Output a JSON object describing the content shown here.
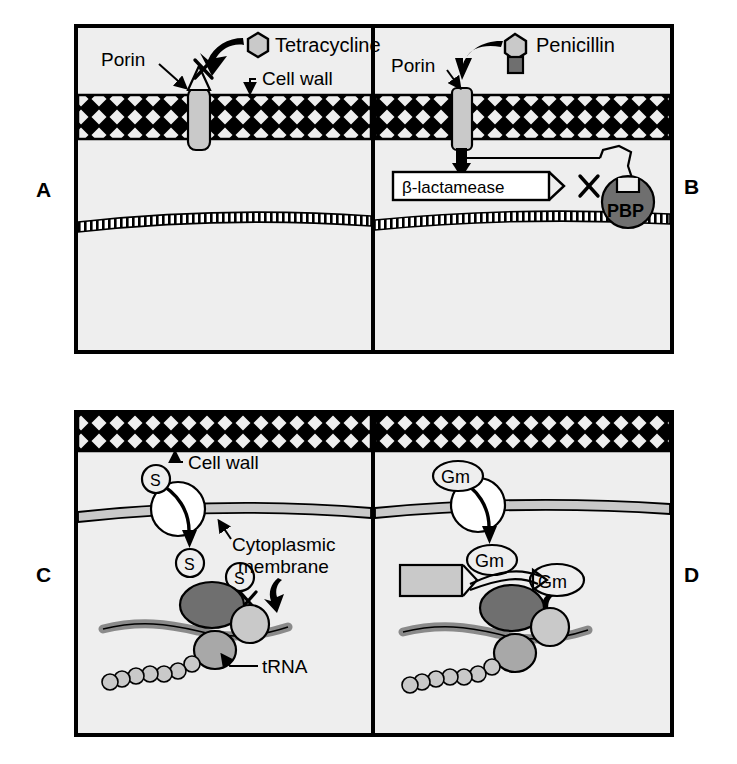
{
  "figure": {
    "background": "#ffffff",
    "panel_fill": "#eeeeee",
    "stroke": "#000000"
  },
  "palette": {
    "panel_fill": "#eeeeee",
    "light_gray": "#c9c9c9",
    "mid_gray": "#a8a8a8",
    "dark_gray": "#6f6f6f",
    "white": "#ffffff",
    "black": "#000000"
  },
  "panels": [
    {
      "id": "A",
      "letter": "A",
      "label_side": "left",
      "mechanism": "decreased-porin-permeability",
      "drug": "Tetracycline",
      "drug_shape": "hexagon",
      "labels": [
        {
          "name": "porin",
          "text": "Porin"
        },
        {
          "name": "drug",
          "text": "Tetracycline"
        },
        {
          "name": "cell-wall",
          "text": "Cell wall"
        },
        {
          "name": "block-marker",
          "text": "X"
        }
      ]
    },
    {
      "id": "B",
      "letter": "B",
      "label_side": "right",
      "mechanism": "enzymatic-drug-inactivation",
      "drug": "Penicillin",
      "drug_shape": "hexagon-with-tail",
      "labels": [
        {
          "name": "porin",
          "text": "Porin"
        },
        {
          "name": "drug",
          "text": "Penicillin"
        },
        {
          "name": "enzyme",
          "text": "β-lactamease"
        },
        {
          "name": "target-protein",
          "text": "PBP"
        },
        {
          "name": "block-marker",
          "text": "X"
        }
      ]
    },
    {
      "id": "C",
      "letter": "C",
      "label_side": "left",
      "mechanism": "altered-ribosomal-target",
      "drug": "S",
      "drug_name_abbrev": "S",
      "labels": [
        {
          "name": "cell-wall",
          "text": "Cell wall"
        },
        {
          "name": "cytoplasmic-membrane-line1",
          "text": "Cytoplasmic"
        },
        {
          "name": "cytoplasmic-membrane-line2",
          "text": "membrane"
        },
        {
          "name": "trna",
          "text": "tRNA"
        },
        {
          "name": "drug-extracellular",
          "text": "S"
        },
        {
          "name": "drug-intracellular",
          "text": "S"
        },
        {
          "name": "drug-blocked",
          "text": "S"
        },
        {
          "name": "block-marker",
          "text": "X"
        }
      ]
    },
    {
      "id": "D",
      "letter": "D",
      "label_side": "right",
      "mechanism": "enzymatic-modification-of-aminoglycoside",
      "drug": "Gm",
      "drug_name_abbrev": "Gm",
      "labels": [
        {
          "name": "drug-extracellular",
          "text": "Gm"
        },
        {
          "name": "drug-intracellular",
          "text": "Gm"
        },
        {
          "name": "drug-modified",
          "text": "Gm"
        },
        {
          "name": "modifying-enzyme",
          "text": ""
        },
        {
          "name": "block-marker",
          "text": "X"
        }
      ]
    }
  ]
}
